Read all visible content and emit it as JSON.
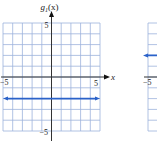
{
  "chart_data": [
    {
      "type": "line",
      "title": "g1(x)",
      "title_main": "g",
      "title_sub": "1",
      "title_arg": "(x)",
      "xlabel": "x",
      "ylabel": "g1(x)",
      "xlim": [
        -5,
        5
      ],
      "ylim": [
        -5,
        5
      ],
      "grid": true,
      "x_tick_labels": [
        "-5",
        "5"
      ],
      "y_tick_labels": [
        "5",
        "-5"
      ],
      "series": [
        {
          "name": "g1(x)",
          "kind": "horizontal-line",
          "y": -2,
          "x": [
            -5,
            5
          ],
          "arrows": "both",
          "color": "#2a62c9"
        }
      ]
    },
    {
      "type": "line",
      "partial": true,
      "xlim": [
        -5,
        5
      ],
      "ylim": [
        -5,
        5
      ],
      "grid": true,
      "x_tick_labels": [
        "-5"
      ],
      "series": [
        {
          "name": "second function",
          "kind": "horizontal-line",
          "y": 2,
          "arrows": "left",
          "color": "#2a62c9"
        }
      ]
    }
  ],
  "colors": {
    "grid": "#9db3dc",
    "axis": "#333333",
    "series": "#2a62c9"
  },
  "labels": {
    "minus5": "−5",
    "plus5": "5",
    "x": "x"
  }
}
